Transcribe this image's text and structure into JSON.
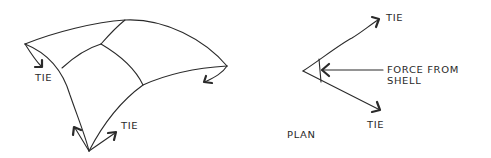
{
  "diagram": {
    "type": "structural-sketch",
    "stroke_color": "#2a2a2a",
    "background": "#ffffff",
    "shell_view": {
      "description": "Perspective sketch of a curved shell panel with three supports and tie arrows",
      "labels": {
        "tie_left": "TIE",
        "tie_bottom": "TIE"
      },
      "corners": {
        "left": [
          25,
          44
        ],
        "top_junction": [
          125,
          20
        ],
        "right": [
          227,
          66
        ],
        "bottom": [
          89,
          151
        ]
      }
    },
    "plan_view": {
      "title": "PLAN",
      "labels": {
        "tie_upper": "TIE",
        "tie_lower": "TIE",
        "force_line1": "FORCE FROM",
        "force_line2": "SHELL"
      },
      "apex": [
        303,
        71
      ]
    }
  }
}
